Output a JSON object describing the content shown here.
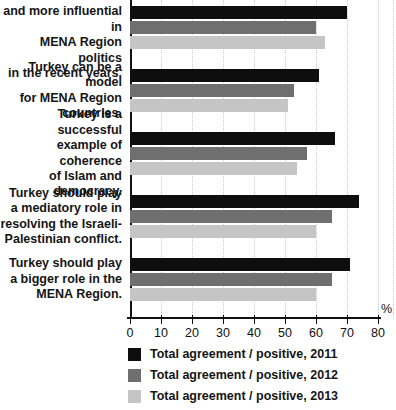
{
  "chart_data": {
    "type": "bar",
    "orientation": "horizontal",
    "title": "",
    "xlabel": "%",
    "ylabel": "",
    "xlim": [
      0,
      80
    ],
    "x_ticks": [
      0,
      10,
      20,
      30,
      40,
      50,
      60,
      70,
      80
    ],
    "grid": "vertical dotted",
    "legend_position": "bottom",
    "categories": [
      "Turkey has become more and more influential in MENA Region politics in the recent years.",
      "Turkey can be a model for MENA Region countries.",
      "Turkey is a successful example of coherence of Islam and democracy.",
      "Turkey should play a mediatory role in resolving the Israeli-Palestinian conflict.",
      "Turkey should play a bigger role in the MENA Region."
    ],
    "category_lines": [
      [
        "Turkey has become more",
        "and more influential in",
        "MENA Region politics",
        "in the recent years."
      ],
      [
        "Turkey can be a model",
        "for MENA Region",
        "countries."
      ],
      [
        "Turkey is a successful",
        "example of coherence",
        "of Islam and democracy."
      ],
      [
        "Turkey should play",
        "a mediatory role in",
        "resolving the Israeli-",
        "Palestinian conflict."
      ],
      [
        "Turkey should play",
        "a bigger role in the",
        "MENA Region."
      ]
    ],
    "series": [
      {
        "name": "Total agreement / positive, 2011",
        "color": "#0e0e0e",
        "values": [
          70,
          61,
          66,
          74,
          71
        ]
      },
      {
        "name": "Total agreement / positive, 2012",
        "color": "#6f6f6f",
        "values": [
          60,
          53,
          57,
          65,
          65
        ]
      },
      {
        "name": "Total agreement / positive, 2013",
        "color": "#c5c5c5",
        "values": [
          63,
          51,
          54,
          60,
          60
        ]
      }
    ]
  }
}
